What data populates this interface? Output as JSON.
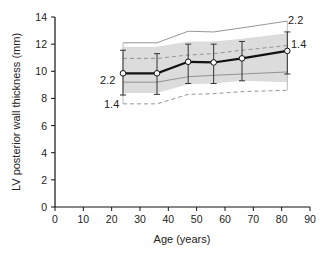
{
  "chart_data": {
    "type": "line",
    "title": "",
    "xlabel": "Age (years)",
    "ylabel": "LV posterior wall thickness (mm)",
    "xlim": [
      0,
      90
    ],
    "ylim": [
      0,
      14
    ],
    "xticks": [
      0,
      10,
      20,
      30,
      40,
      50,
      60,
      70,
      80,
      90
    ],
    "yticks": [
      0,
      2,
      4,
      6,
      8,
      10,
      12,
      14
    ],
    "grid": false,
    "legend": null,
    "series": [
      {
        "name": "mean",
        "style": "thick solid black line with open circle markers and error bars",
        "x": [
          24,
          36,
          47,
          56,
          66,
          82
        ],
        "y": [
          9.85,
          9.85,
          10.7,
          10.65,
          10.95,
          11.5
        ],
        "error_low": [
          8.25,
          8.3,
          9.1,
          9.1,
          9.3,
          9.8
        ],
        "error_high": [
          11.55,
          11.3,
          12.0,
          12.0,
          12.2,
          12.9
        ]
      },
      {
        "name": "upper outer limit (+2.2 SD)",
        "style": "thin solid gray",
        "x": [
          24,
          36,
          47,
          56,
          66,
          82
        ],
        "y": [
          12.1,
          12.1,
          12.95,
          12.9,
          13.2,
          13.7
        ]
      },
      {
        "name": "upper inner limit (+1.4 SD)",
        "style": "dashed gray",
        "x": [
          24,
          36,
          47,
          56,
          66,
          82
        ],
        "y": [
          10.95,
          10.95,
          11.2,
          11.3,
          11.55,
          11.9
        ]
      },
      {
        "name": "lower inner limit (-1.4 SD)",
        "style": "thin solid gray",
        "x": [
          24,
          36,
          47,
          56,
          66,
          82
        ],
        "y": [
          9.2,
          9.2,
          9.6,
          9.7,
          9.8,
          9.95
        ]
      },
      {
        "name": "lower outer limit (-2.2 SD)",
        "style": "dashed gray",
        "x": [
          24,
          36,
          47,
          56,
          66,
          82
        ],
        "y": [
          7.6,
          7.6,
          8.3,
          8.35,
          8.5,
          8.6
        ]
      },
      {
        "name": "shaded band",
        "style": "light gray fill",
        "x": [
          24,
          36,
          47,
          56,
          66,
          82
        ],
        "y_low": [
          8.4,
          8.4,
          9.05,
          9.1,
          9.3,
          9.2
        ],
        "y_high": [
          11.8,
          11.8,
          12.2,
          12.2,
          12.4,
          12.8
        ]
      }
    ],
    "annotations": [
      {
        "text": "2.2",
        "position": "left of first point"
      },
      {
        "text": "1.4",
        "position": "lower-left, at lower dashed line"
      },
      {
        "text": "2.2",
        "position": "upper-right, end of upper solid line"
      },
      {
        "text": "1.4",
        "position": "right, near upper dashed line end"
      }
    ]
  },
  "labels": {
    "xlabel": "Age (years)",
    "ylabel": "LV posterior wall thickness (mm)",
    "ann_left_upper": "2.2",
    "ann_left_lower": "1.4",
    "ann_right_upper": "2.2",
    "ann_right_lower": "1.4"
  },
  "colors": {
    "mean_line": "#111111",
    "limit_line": "#8a8a8a",
    "band_fill": "#dcdcdc",
    "error_bar": "#333333",
    "axis": "#111111"
  }
}
